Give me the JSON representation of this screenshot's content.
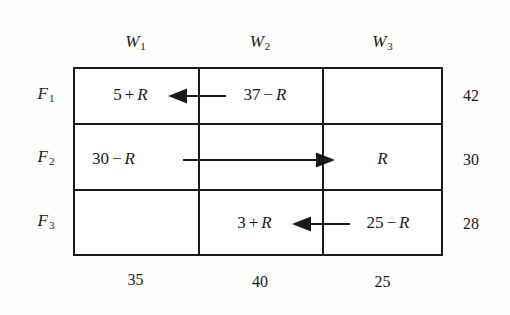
{
  "figure": {
    "type": "transportation-tableau",
    "rows": 3,
    "columns": 3
  },
  "columns": [
    {
      "label": "W",
      "subscript": "1",
      "demand": "35"
    },
    {
      "label": "W",
      "subscript": "2",
      "demand": "40"
    },
    {
      "label": "W",
      "subscript": "3",
      "demand": "25"
    }
  ],
  "rows": [
    {
      "label": "F",
      "subscript": "1",
      "supply": "42"
    },
    {
      "label": "F",
      "subscript": "2",
      "supply": "30"
    },
    {
      "label": "F",
      "subscript": "3",
      "supply": "28"
    }
  ],
  "cells": {
    "r1c1": {
      "number": "5",
      "operator": "+",
      "variable": "R"
    },
    "r1c2": {
      "number": "37",
      "operator": "−",
      "variable": "R"
    },
    "r1c3": {
      "number": "",
      "operator": "",
      "variable": ""
    },
    "r2c1": {
      "number": "30",
      "operator": "−",
      "variable": "R"
    },
    "r2c2": {
      "number": "",
      "operator": "",
      "variable": ""
    },
    "r2c3": {
      "number": "",
      "operator": "",
      "variable": "R"
    },
    "r3c1": {
      "number": "",
      "operator": "",
      "variable": ""
    },
    "r3c2": {
      "number": "3",
      "operator": "+",
      "variable": "R"
    },
    "r3c3": {
      "number": "25",
      "operator": "−",
      "variable": "R"
    }
  },
  "arrows": [
    {
      "name": "arrow-row1-w2-to-w1",
      "direction": "left",
      "row": "1",
      "from": "W2",
      "to": "W1"
    },
    {
      "name": "arrow-row2-w1-to-w3",
      "direction": "right",
      "row": "2",
      "from": "W1",
      "to": "W3"
    },
    {
      "name": "arrow-row3-w3-to-w2",
      "direction": "left",
      "row": "3",
      "from": "W3",
      "to": "W2"
    }
  ],
  "colors": {
    "ink": "#1a1a1a",
    "background": "#fdfdfb",
    "cell_fill": "#ffffff"
  }
}
